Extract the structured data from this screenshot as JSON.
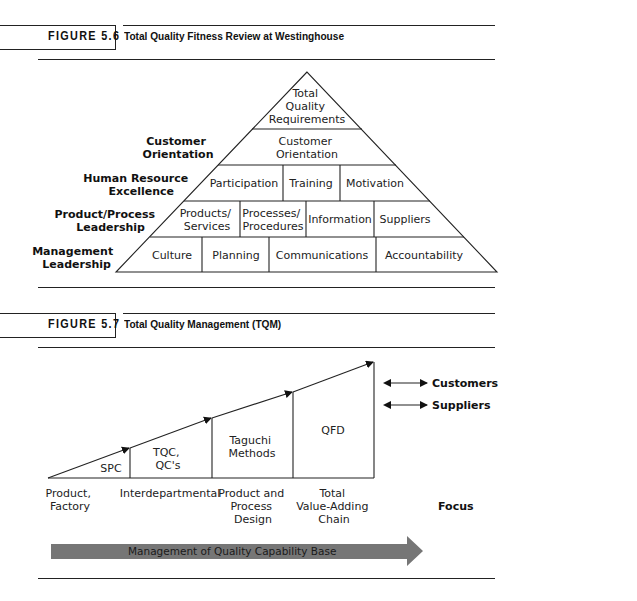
{
  "figure_5_6": {
    "number": "FIGURE 5.6",
    "title": "Total Quality Fitness Review at Westinghouse",
    "apex": [
      "Total",
      "Quality",
      "Requirements"
    ],
    "side_labels": [
      [
        "Customer",
        "Orientation"
      ],
      [
        "Human Resource",
        "Excellence"
      ],
      [
        "Product/Process",
        "Leadership"
      ],
      [
        "Management",
        "Leadership"
      ]
    ],
    "rows": [
      {
        "cells": [
          [
            "Customer",
            "Orientation"
          ]
        ]
      },
      {
        "cells": [
          [
            "Participation"
          ],
          [
            "Training"
          ],
          [
            "Motivation"
          ]
        ]
      },
      {
        "cells": [
          [
            "Products/",
            "Services"
          ],
          [
            "Processes/",
            "Procedures"
          ],
          [
            "Information"
          ],
          [
            "Suppliers"
          ]
        ]
      },
      {
        "cells": [
          [
            "Culture"
          ],
          [
            "Planning"
          ],
          [
            "Communications"
          ],
          [
            "Accountability"
          ]
        ]
      }
    ]
  },
  "figure_5_7": {
    "number": "FIGURE 5.7",
    "title": "Total Quality Management (TQM)",
    "stages": [
      {
        "label": [
          "SPC"
        ],
        "focus": [
          "Product,",
          "Factory"
        ]
      },
      {
        "label": [
          "TQC,",
          "QC's"
        ],
        "focus": [
          "Interdepartmental"
        ]
      },
      {
        "label": [
          "Taguchi",
          "Methods"
        ],
        "focus": [
          "Product and",
          "Process",
          "Design"
        ]
      },
      {
        "label": [
          "QFD"
        ],
        "focus": [
          "Total",
          "Value-Adding",
          "Chain"
        ]
      }
    ],
    "links": [
      "Customers",
      "Suppliers"
    ],
    "focus_label": "Focus",
    "base_arrow_label": "Management of Quality Capability Base",
    "arrow_color": "#7a7a7a"
  }
}
